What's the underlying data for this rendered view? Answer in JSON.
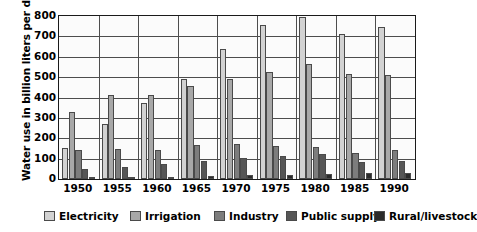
{
  "chart_data": {
    "type": "bar",
    "title": "",
    "xlabel": "",
    "ylabel": "Water use in billion liters per day",
    "ylim": [
      0,
      800
    ],
    "yticks": [
      0,
      100,
      200,
      300,
      400,
      500,
      600,
      700,
      800
    ],
    "grid": true,
    "legend_position": "bottom",
    "categories": [
      "1950",
      "1955",
      "1960",
      "1965",
      "1970",
      "1975",
      "1980",
      "1985",
      "1990"
    ],
    "series": [
      {
        "name": "Electricity",
        "color": "#d2d2d2",
        "values": [
          150,
          270,
          375,
          490,
          640,
          755,
          795,
          710,
          745
        ]
      },
      {
        "name": "Irrigation",
        "color": "#a8a8a8",
        "values": [
          330,
          410,
          410,
          455,
          490,
          525,
          565,
          515,
          510
        ]
      },
      {
        "name": "Industry",
        "color": "#7d7d7d",
        "values": [
          140,
          145,
          143,
          165,
          170,
          160,
          155,
          130,
          140
        ]
      },
      {
        "name": "Public supply",
        "color": "#565656",
        "values": [
          50,
          60,
          75,
          90,
          105,
          115,
          125,
          85,
          90
        ]
      },
      {
        "name": "Rural/livestock",
        "color": "#2b2b2b",
        "values": [
          10,
          10,
          12,
          15,
          18,
          20,
          25,
          28,
          30
        ]
      }
    ]
  }
}
